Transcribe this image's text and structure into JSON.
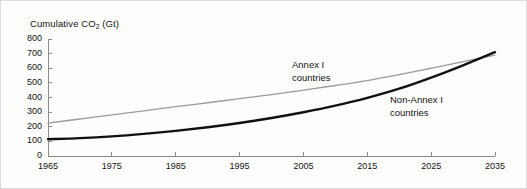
{
  "chart_data": {
    "type": "line",
    "title": "Cumulative CO2 (Gt)",
    "title_prefix": "Cumulative CO",
    "title_subscript": "2",
    "title_suffix": " (Gt)",
    "xlabel": "",
    "ylabel": "Cumulative CO2 (Gt)",
    "xlim": [
      1965,
      2035
    ],
    "ylim": [
      0,
      800
    ],
    "grid": false,
    "legend_position": "inline-annotations",
    "yticks": [
      "800",
      "700",
      "600",
      "500",
      "400",
      "300",
      "200",
      "100",
      "0"
    ],
    "ytick_values": [
      800,
      700,
      600,
      500,
      400,
      300,
      200,
      100,
      0
    ],
    "xticks": [
      "1965",
      "1975",
      "1985",
      "1995",
      "2005",
      "2015",
      "2025",
      "2035"
    ],
    "xtick_values": [
      1965,
      1975,
      1985,
      1995,
      2005,
      2015,
      2025,
      2035
    ],
    "x": [
      1965,
      1970,
      1975,
      1980,
      1985,
      1990,
      1995,
      2000,
      2005,
      2010,
      2015,
      2020,
      2025,
      2030,
      2035
    ],
    "series": [
      {
        "name": "Annex I countries",
        "annotation_line1": "Annex I",
        "annotation_line2": "countries",
        "color": "#9a9a9a",
        "width": 1.3,
        "values": [
          225,
          253,
          281,
          309,
          337,
          364,
          392,
          420,
          450,
          482,
          516,
          556,
          600,
          645,
          690
        ]
      },
      {
        "name": "Non-Annex I countries",
        "annotation_line1": "Non-Annex I",
        "annotation_line2": "countries",
        "color": "#111111",
        "width": 2.4,
        "values": [
          115,
          122,
          134,
          151,
          172,
          197,
          226,
          260,
          299,
          344,
          397,
          460,
          536,
          620,
          710
        ]
      }
    ],
    "axis_color": "#8c8c8c",
    "text_color": "#141414",
    "background": "#fdfdfc",
    "border_color": "#dcdcd8"
  },
  "geometry": {
    "plot_left": 47,
    "plot_right": 494,
    "plot_top": 38,
    "plot_bottom": 155
  }
}
